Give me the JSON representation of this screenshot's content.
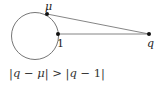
{
  "diagram": {
    "circle": {
      "cx": 35,
      "cy": 36,
      "r": 23.5,
      "stroke": "#666666"
    },
    "points": [
      {
        "id": "mu",
        "label": "μ",
        "x": 47,
        "y": 14
      },
      {
        "id": "one",
        "label": "1",
        "x": 58,
        "y": 34
      },
      {
        "id": "q",
        "label": "q",
        "x": 149,
        "y": 34
      }
    ],
    "segments": [
      {
        "from": "mu",
        "to": "q"
      },
      {
        "from": "one",
        "to": "q"
      }
    ],
    "line_color": "#777777",
    "point_color": "#111111"
  },
  "caption": {
    "q1": "q",
    "minus1": " − ",
    "mu": "μ",
    "gt": " > ",
    "q2": "q",
    "minus2": " − ",
    "one": "1",
    "bar": "|"
  }
}
